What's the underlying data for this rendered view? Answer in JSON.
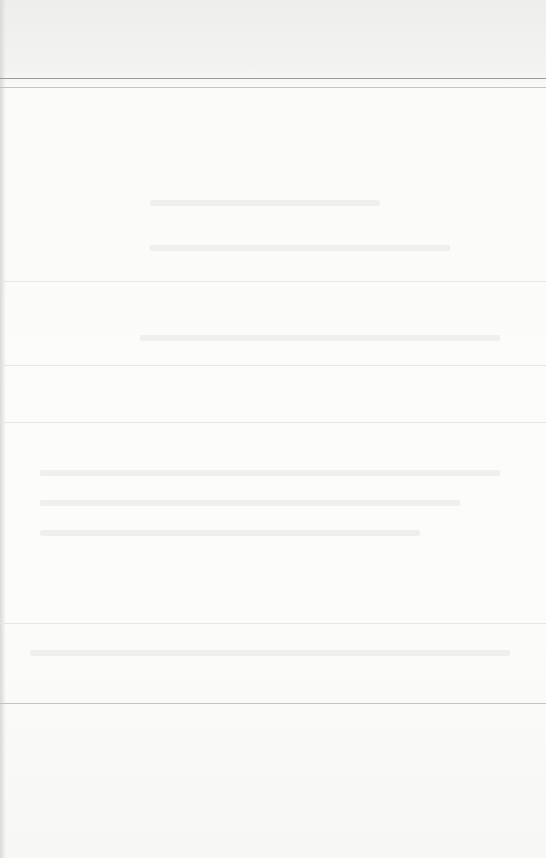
{
  "page": {
    "type": "blank-scanned-page",
    "background_color": "#fbfbfa",
    "rule_color_dark": "#9a9a98",
    "rule_color_faint": "#e6e6e4"
  },
  "rules": [
    {
      "y": 78,
      "strength": "dark"
    },
    {
      "y": 87,
      "strength": "mid"
    },
    {
      "y": 281,
      "strength": "faint"
    },
    {
      "y": 365,
      "strength": "faint"
    },
    {
      "y": 422,
      "strength": "faint"
    },
    {
      "y": 623,
      "strength": "faint"
    },
    {
      "y": 703,
      "strength": "mid"
    }
  ],
  "text": {
    "note": ""
  }
}
